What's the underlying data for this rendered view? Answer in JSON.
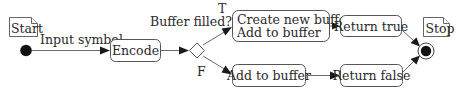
{
  "diagram": {
    "type": "UML activity diagram",
    "start": {
      "note_label": "Start"
    },
    "stop": {
      "note_label": "Stop"
    },
    "edges": {
      "start_to_encode": "Input symbol",
      "decision_question": "Buffer filled?",
      "true_branch": "T",
      "false_branch": "F"
    },
    "actions": {
      "encode": "Encode",
      "create_new_buffer_line1": "Create new buffer",
      "create_new_buffer_line2": "Add to buffer",
      "return_true": "Return true",
      "add_to_buffer": "Add to buffer",
      "return_false": "Return false"
    },
    "colors": {
      "stroke": "#555555",
      "node_fill": "#111111",
      "background": "#ffffff"
    }
  }
}
